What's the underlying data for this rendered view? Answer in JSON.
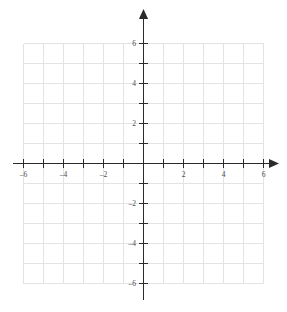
{
  "figure": {
    "kind": "cartesian-coordinate-grid",
    "background_color": "#ffffff",
    "grid_color": "#e3e3e3",
    "axis_color": "#2b2b2b",
    "label_color": "#4a4a4a",
    "width_px": 287,
    "height_px": 312
  },
  "chart_data": {
    "type": "scatter",
    "title": "",
    "subtitle": "",
    "xlabel": "",
    "ylabel": "",
    "xlim": [
      -6,
      6
    ],
    "ylim": [
      -6,
      6
    ],
    "grid": true,
    "legend": null,
    "series": [],
    "x": [],
    "y": [],
    "annotations": [],
    "x_major_ticks": [
      -6,
      -5,
      -4,
      -3,
      -2,
      -1,
      1,
      2,
      3,
      4,
      5,
      6
    ],
    "y_major_ticks": [
      -6,
      -5,
      -4,
      -3,
      -2,
      -1,
      1,
      2,
      3,
      4,
      5,
      6
    ],
    "x_tick_labels": [
      {
        "value": -6,
        "text": "–6"
      },
      {
        "value": -4,
        "text": "–4"
      },
      {
        "value": -2,
        "text": "–2"
      },
      {
        "value": 2,
        "text": "2"
      },
      {
        "value": 4,
        "text": "4"
      },
      {
        "value": 6,
        "text": "6"
      }
    ],
    "y_tick_labels": [
      {
        "value": 6,
        "text": "6"
      },
      {
        "value": 4,
        "text": "4"
      },
      {
        "value": 2,
        "text": "2"
      },
      {
        "value": -2,
        "text": "–2"
      },
      {
        "value": -4,
        "text": "–4"
      },
      {
        "value": -6,
        "text": "–6"
      }
    ],
    "gridlines_x": [
      -6,
      -5,
      -4,
      -3,
      -2,
      -1,
      0,
      1,
      2,
      3,
      4,
      5,
      6
    ],
    "gridlines_y": [
      -6,
      -5,
      -4,
      -3,
      -2,
      -1,
      0,
      1,
      2,
      3,
      4,
      5,
      6
    ],
    "origin_label": "",
    "units_per_division": 1,
    "px_per_unit": 20,
    "arrowheads": [
      "x-positive",
      "y-positive"
    ]
  },
  "top_artifact": {
    "text": " "
  }
}
